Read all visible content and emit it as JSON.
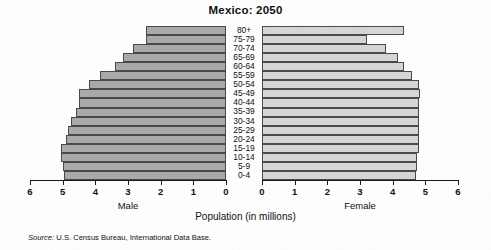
{
  "title": "Mexico: 2050",
  "xlabel": "Population (in millions)",
  "source_word": "Source:",
  "source_text": " U.S. Census Bureau, International Data Base.",
  "left_panel_label": "Male",
  "right_panel_label": "Female",
  "colors": {
    "male_bar": "#a9a9a9",
    "female_bar": "#d5d5d5",
    "bar_border": "#4a4a4a",
    "axis": "#1a1a1a",
    "background": "#ffffff"
  },
  "chart_data": {
    "type": "bar",
    "subtype": "population-pyramid",
    "title": "Mexico: 2050",
    "xlabel": "Population (in millions)",
    "ylabel": "",
    "grid": false,
    "legend": false,
    "orientation": "horizontal",
    "categories": [
      "80+",
      "75-79",
      "70-74",
      "65-69",
      "60-64",
      "55-59",
      "50-54",
      "45-49",
      "40-44",
      "35-39",
      "30-34",
      "25-29",
      "20-24",
      "15-19",
      "10-14",
      "5-9",
      "0-4"
    ],
    "axis_ticks_left": [
      "6",
      "5",
      "4",
      "3",
      "2",
      "1",
      "0"
    ],
    "axis_ticks_right": [
      "0",
      "1",
      "2",
      "3",
      "4",
      "5",
      "6"
    ],
    "xlim_left": [
      6,
      0
    ],
    "xlim_right": [
      0,
      6
    ],
    "series": [
      {
        "name": "Male",
        "side": "left",
        "values": [
          2.45,
          2.45,
          2.85,
          3.15,
          3.4,
          3.85,
          4.2,
          4.5,
          4.5,
          4.6,
          4.75,
          4.85,
          4.9,
          5.05,
          5.05,
          5.0,
          4.95
        ]
      },
      {
        "name": "Female",
        "side": "right",
        "values": [
          4.35,
          3.2,
          3.8,
          4.15,
          4.35,
          4.6,
          4.8,
          4.85,
          4.8,
          4.8,
          4.8,
          4.8,
          4.8,
          4.8,
          4.75,
          4.75,
          4.7
        ]
      }
    ]
  }
}
